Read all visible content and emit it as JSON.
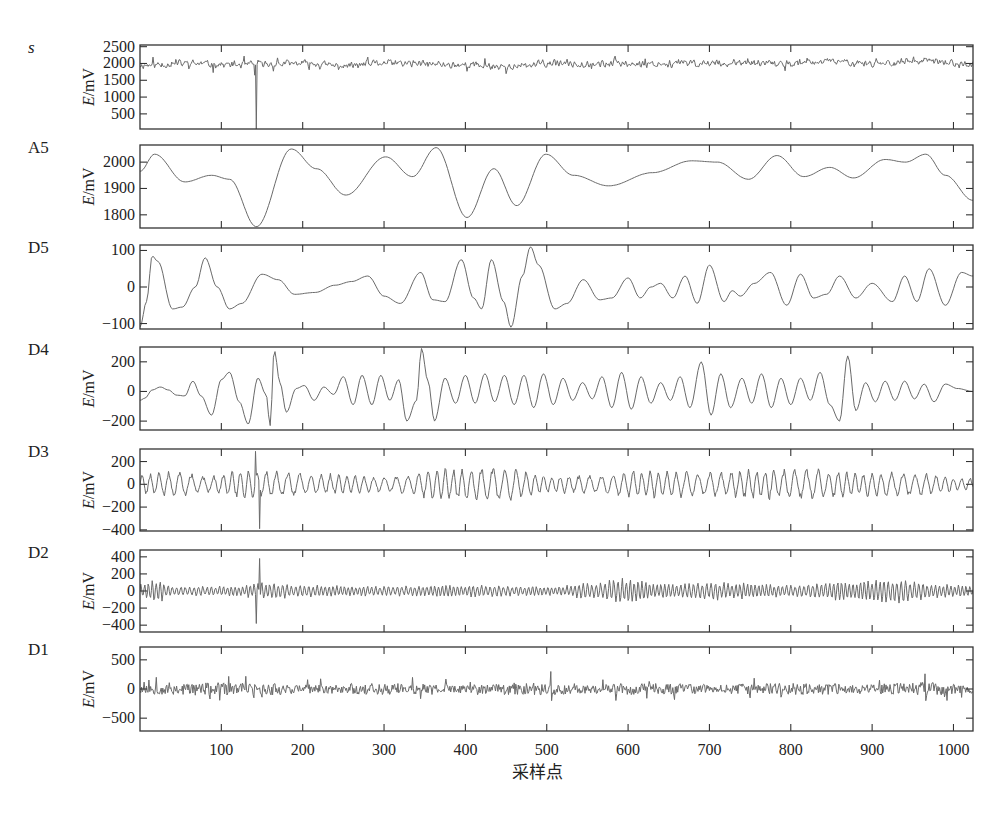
{
  "chart_data": {
    "type": "line",
    "title": "",
    "xlabel": "采样点",
    "xlim": [
      0,
      1024
    ],
    "xticks": [
      100,
      200,
      300,
      400,
      500,
      600,
      700,
      800,
      900,
      1000
    ],
    "grid": false,
    "legend": null,
    "panels": [
      {
        "name": "s",
        "name_italic": true,
        "ylabel": "E/mV",
        "ylim": [
          50,
          2550
        ],
        "yticks": [
          500,
          1000,
          1500,
          2000,
          2500
        ],
        "description": "original signal, noisy around ~1950-2050 mV with a sharp dip to ~50 at sample ~143",
        "baseline": 1980,
        "noise_amplitude": 110,
        "seed": 11,
        "spikes": [
          {
            "x": 143,
            "y": 50
          },
          {
            "x": 141,
            "y": 1650
          }
        ],
        "keypoints": [
          [
            0,
            1950
          ],
          [
            60,
            2000
          ],
          [
            120,
            1960
          ],
          [
            200,
            2000
          ],
          [
            250,
            1930
          ],
          [
            300,
            2010
          ],
          [
            400,
            1960
          ],
          [
            460,
            1900
          ],
          [
            500,
            2000
          ],
          [
            600,
            1990
          ],
          [
            700,
            2010
          ],
          [
            800,
            1990
          ],
          [
            850,
            2060
          ],
          [
            900,
            2010
          ],
          [
            960,
            2070
          ],
          [
            1024,
            1970
          ]
        ]
      },
      {
        "name": "A5",
        "ylabel": "E/mV",
        "ylim": [
          1750,
          2065
        ],
        "yticks": [
          1800,
          1900,
          2000
        ],
        "description": "level-5 approximation, smooth",
        "keypoints": [
          [
            0,
            1965
          ],
          [
            18,
            2030
          ],
          [
            55,
            1925
          ],
          [
            88,
            1950
          ],
          [
            110,
            1935
          ],
          [
            143,
            1755
          ],
          [
            186,
            2050
          ],
          [
            217,
            1975
          ],
          [
            253,
            1875
          ],
          [
            302,
            2020
          ],
          [
            335,
            1945
          ],
          [
            364,
            2055
          ],
          [
            402,
            1790
          ],
          [
            435,
            1975
          ],
          [
            463,
            1835
          ],
          [
            499,
            2030
          ],
          [
            533,
            1950
          ],
          [
            576,
            1910
          ],
          [
            630,
            1960
          ],
          [
            678,
            2005
          ],
          [
            710,
            2000
          ],
          [
            748,
            1935
          ],
          [
            783,
            2025
          ],
          [
            816,
            1945
          ],
          [
            848,
            1980
          ],
          [
            877,
            1940
          ],
          [
            916,
            2010
          ],
          [
            941,
            2000
          ],
          [
            966,
            2030
          ],
          [
            990,
            1950
          ],
          [
            1024,
            1855
          ]
        ]
      },
      {
        "name": "D5",
        "ylabel": "",
        "ylim": [
          -115,
          115
        ],
        "yticks": [
          -100,
          0,
          100
        ],
        "description": "level-5 detail, oscillatory",
        "keypoints": [
          [
            0,
            -110
          ],
          [
            8,
            -40
          ],
          [
            15,
            85
          ],
          [
            22,
            70
          ],
          [
            40,
            -60
          ],
          [
            52,
            -55
          ],
          [
            68,
            0
          ],
          [
            80,
            80
          ],
          [
            95,
            0
          ],
          [
            110,
            -60
          ],
          [
            125,
            -45
          ],
          [
            150,
            35
          ],
          [
            170,
            20
          ],
          [
            190,
            -20
          ],
          [
            215,
            -15
          ],
          [
            240,
            5
          ],
          [
            260,
            15
          ],
          [
            280,
            30
          ],
          [
            300,
            -25
          ],
          [
            320,
            -45
          ],
          [
            345,
            40
          ],
          [
            360,
            -35
          ],
          [
            375,
            -40
          ],
          [
            395,
            75
          ],
          [
            410,
            -30
          ],
          [
            420,
            -60
          ],
          [
            432,
            75
          ],
          [
            447,
            -40
          ],
          [
            456,
            -110
          ],
          [
            470,
            30
          ],
          [
            480,
            110
          ],
          [
            490,
            60
          ],
          [
            510,
            -60
          ],
          [
            525,
            -45
          ],
          [
            545,
            20
          ],
          [
            565,
            -35
          ],
          [
            580,
            -30
          ],
          [
            600,
            25
          ],
          [
            615,
            -30
          ],
          [
            628,
            0
          ],
          [
            640,
            10
          ],
          [
            655,
            -30
          ],
          [
            670,
            30
          ],
          [
            685,
            -45
          ],
          [
            700,
            60
          ],
          [
            718,
            -40
          ],
          [
            728,
            -10
          ],
          [
            738,
            -25
          ],
          [
            755,
            10
          ],
          [
            775,
            40
          ],
          [
            795,
            -50
          ],
          [
            812,
            35
          ],
          [
            828,
            -30
          ],
          [
            844,
            -20
          ],
          [
            860,
            30
          ],
          [
            880,
            -30
          ],
          [
            900,
            10
          ],
          [
            925,
            -40
          ],
          [
            940,
            30
          ],
          [
            955,
            -40
          ],
          [
            970,
            50
          ],
          [
            990,
            -50
          ],
          [
            1010,
            40
          ],
          [
            1024,
            30
          ]
        ]
      },
      {
        "name": "D4",
        "ylabel": "E/mV",
        "ylim": [
          -260,
          300
        ],
        "yticks": [
          -200,
          0,
          200
        ],
        "description": "level-4 detail, oscillatory with spikes at ~165, ~345, ~870",
        "keypoints": [
          [
            0,
            -60
          ],
          [
            6,
            -45
          ],
          [
            15,
            10
          ],
          [
            25,
            30
          ],
          [
            35,
            10
          ],
          [
            45,
            -25
          ],
          [
            55,
            -30
          ],
          [
            65,
            70
          ],
          [
            75,
            -30
          ],
          [
            88,
            -160
          ],
          [
            100,
            80
          ],
          [
            110,
            130
          ],
          [
            122,
            -70
          ],
          [
            133,
            -220
          ],
          [
            145,
            90
          ],
          [
            155,
            -20
          ],
          [
            160,
            -230
          ],
          [
            165,
            280
          ],
          [
            172,
            60
          ],
          [
            180,
            -140
          ],
          [
            192,
            20
          ],
          [
            202,
            40
          ],
          [
            214,
            -60
          ],
          [
            226,
            30
          ],
          [
            238,
            -20
          ],
          [
            250,
            100
          ],
          [
            262,
            -90
          ],
          [
            273,
            110
          ],
          [
            285,
            -90
          ],
          [
            296,
            110
          ],
          [
            307,
            -60
          ],
          [
            318,
            80
          ],
          [
            328,
            -200
          ],
          [
            340,
            -60
          ],
          [
            346,
            290
          ],
          [
            354,
            70
          ],
          [
            362,
            -200
          ],
          [
            375,
            90
          ],
          [
            388,
            -80
          ],
          [
            400,
            110
          ],
          [
            412,
            -80
          ],
          [
            424,
            120
          ],
          [
            436,
            -70
          ],
          [
            448,
            110
          ],
          [
            460,
            -90
          ],
          [
            472,
            110
          ],
          [
            484,
            -110
          ],
          [
            496,
            120
          ],
          [
            508,
            -90
          ],
          [
            520,
            90
          ],
          [
            532,
            -60
          ],
          [
            544,
            60
          ],
          [
            556,
            -50
          ],
          [
            568,
            100
          ],
          [
            580,
            -110
          ],
          [
            592,
            130
          ],
          [
            604,
            -120
          ],
          [
            616,
            100
          ],
          [
            628,
            -80
          ],
          [
            640,
            60
          ],
          [
            652,
            -60
          ],
          [
            664,
            100
          ],
          [
            676,
            -110
          ],
          [
            690,
            200
          ],
          [
            702,
            -160
          ],
          [
            714,
            120
          ],
          [
            726,
            -110
          ],
          [
            740,
            90
          ],
          [
            752,
            -80
          ],
          [
            764,
            120
          ],
          [
            776,
            -110
          ],
          [
            788,
            90
          ],
          [
            800,
            -90
          ],
          [
            812,
            90
          ],
          [
            824,
            -60
          ],
          [
            836,
            130
          ],
          [
            848,
            -90
          ],
          [
            860,
            -200
          ],
          [
            870,
            240
          ],
          [
            880,
            -130
          ],
          [
            892,
            60
          ],
          [
            904,
            -70
          ],
          [
            916,
            70
          ],
          [
            928,
            -60
          ],
          [
            940,
            70
          ],
          [
            952,
            -50
          ],
          [
            964,
            50
          ],
          [
            976,
            -70
          ],
          [
            990,
            50
          ],
          [
            1005,
            20
          ],
          [
            1024,
            0
          ]
        ]
      },
      {
        "name": "D3",
        "ylabel": "E/mV",
        "ylim": [
          -410,
          310
        ],
        "yticks": [
          -400,
          -200,
          0,
          200
        ],
        "description": "level-3 detail, higher-frequency oscillation with large spike at ~145",
        "baseline": 0,
        "noise_amplitude": 130,
        "period": 12,
        "seed": 23,
        "spikes": [
          {
            "x": 142,
            "y": 290
          },
          {
            "x": 147,
            "y": -390
          }
        ],
        "envelope": [
          [
            0,
            0.7
          ],
          [
            50,
            0.9
          ],
          [
            80,
            0.5
          ],
          [
            120,
            0.9
          ],
          [
            160,
            0.9
          ],
          [
            200,
            0.8
          ],
          [
            260,
            0.6
          ],
          [
            300,
            0.5
          ],
          [
            380,
            1.1
          ],
          [
            440,
            1.2
          ],
          [
            500,
            0.6
          ],
          [
            560,
            0.6
          ],
          [
            620,
            0.9
          ],
          [
            700,
            0.8
          ],
          [
            760,
            1.0
          ],
          [
            820,
            1.0
          ],
          [
            880,
            0.8
          ],
          [
            940,
            0.8
          ],
          [
            1024,
            0.4
          ]
        ]
      },
      {
        "name": "D2",
        "ylabel": "E/mV",
        "ylim": [
          -480,
          480
        ],
        "yticks": [
          -400,
          -200,
          0,
          200,
          400
        ],
        "description": "level-2 detail, noisy with spike near ~145",
        "baseline": 0,
        "noise_amplitude": 110,
        "period": 5,
        "seed": 37,
        "spikes": [
          {
            "x": 143,
            "y": -380
          },
          {
            "x": 147,
            "y": 380
          }
        ],
        "envelope": [
          [
            0,
            0.8
          ],
          [
            20,
            1.2
          ],
          [
            40,
            0.5
          ],
          [
            120,
            0.5
          ],
          [
            150,
            0.9
          ],
          [
            200,
            0.6
          ],
          [
            300,
            0.5
          ],
          [
            400,
            0.6
          ],
          [
            500,
            0.5
          ],
          [
            560,
            0.8
          ],
          [
            590,
            1.3
          ],
          [
            640,
            0.7
          ],
          [
            720,
            0.9
          ],
          [
            800,
            0.6
          ],
          [
            870,
            1.0
          ],
          [
            930,
            1.2
          ],
          [
            980,
            0.7
          ],
          [
            1024,
            0.6
          ]
        ]
      },
      {
        "name": "D1",
        "ylabel": "E/mV",
        "ylim": [
          -720,
          720
        ],
        "yticks": [
          -500,
          0,
          500
        ],
        "description": "level-1 detail, high-frequency noise with spikes near ~505 and ~965",
        "baseline": 0,
        "noise_amplitude": 110,
        "period": 2,
        "seed": 53,
        "spikes": [
          {
            "x": 505,
            "y": 300
          },
          {
            "x": 506,
            "y": -200
          },
          {
            "x": 965,
            "y": 260
          },
          {
            "x": 966,
            "y": -200
          },
          {
            "x": 20,
            "y": 200
          },
          {
            "x": 140,
            "y": -150
          }
        ],
        "envelope": [
          [
            0,
            0.7
          ],
          [
            40,
            1.0
          ],
          [
            80,
            1.0
          ],
          [
            140,
            0.9
          ],
          [
            145,
            0.1
          ],
          [
            150,
            1.0
          ],
          [
            200,
            0.7
          ],
          [
            300,
            0.9
          ],
          [
            400,
            0.7
          ],
          [
            500,
            1.1
          ],
          [
            560,
            0.7
          ],
          [
            600,
            0.9
          ],
          [
            700,
            0.8
          ],
          [
            800,
            0.9
          ],
          [
            900,
            0.8
          ],
          [
            960,
            1.1
          ],
          [
            1024,
            0.6
          ]
        ]
      }
    ]
  }
}
